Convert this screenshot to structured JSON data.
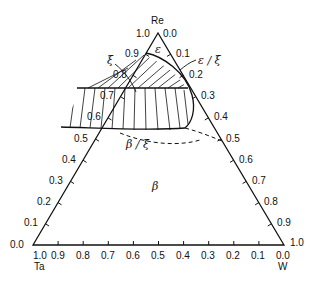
{
  "diagram": {
    "type": "ternary phase diagram",
    "components": {
      "top": "Re",
      "bottom_left": "Ta",
      "bottom_right": "W"
    },
    "apex_labels": {
      "left_of_apex": "1.0",
      "right_of_apex": "0.0"
    },
    "corner_labels": {
      "ta_left": "0.0",
      "ta_below": "1.0",
      "w_right": "1.0",
      "w_below": "0.0"
    },
    "left_axis_ticks": [
      "0.1",
      "0.2",
      "0.3",
      "0.4",
      "0.5",
      "0.6",
      "0.7",
      "0.8",
      "0.9"
    ],
    "right_axis_ticks": [
      "0.1",
      "0.2",
      "0.3",
      "0.4",
      "0.5",
      "0.6",
      "0.7",
      "0.8",
      "0.9"
    ],
    "bottom_axis_ticks": [
      "0.9",
      "0.8",
      "0.7",
      "0.6",
      "0.5",
      "0.4",
      "0.3",
      "0.2",
      "0.1"
    ],
    "phase_labels": {
      "epsilon": "ε",
      "xi": "ξ",
      "epsilon_xi": "ε / ξ",
      "beta_xi": "β / ξ",
      "beta": "β"
    }
  }
}
